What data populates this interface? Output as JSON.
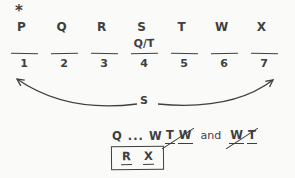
{
  "diagram": {
    "star_label": "*",
    "letters": [
      "P",
      "Q",
      "R",
      "S",
      "T",
      "W",
      "X"
    ],
    "slots": [
      {
        "number": "1",
        "note": ""
      },
      {
        "number": "2",
        "note": ""
      },
      {
        "number": "3",
        "note": ""
      },
      {
        "number": "4",
        "note": "Q/T"
      },
      {
        "number": "5",
        "note": ""
      },
      {
        "number": "6",
        "note": ""
      },
      {
        "number": "7",
        "note": ""
      }
    ],
    "swap_arrow_label": "S",
    "rules": {
      "sequence": "Q ... W",
      "not_pairs": {
        "pair1": [
          "T",
          "W"
        ],
        "conjunction": "and",
        "pair2": [
          "W",
          "T"
        ]
      },
      "boxed_pair": [
        "R",
        "X"
      ]
    },
    "colors": {
      "ink": "#3f3f3f",
      "background": "#fafaf8"
    }
  }
}
